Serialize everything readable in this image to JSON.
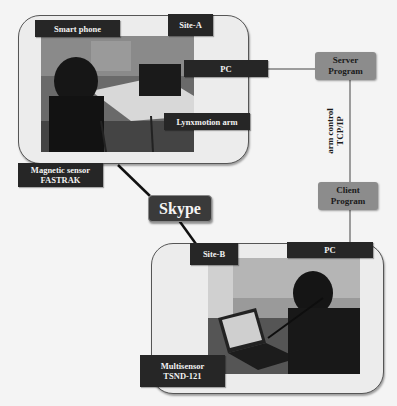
{
  "diagram": {
    "site_a": {
      "label": "Site-A",
      "components": {
        "smart_phone": "Smart phone",
        "pc": "PC",
        "arm": "Lynxmotion arm",
        "sensor_line1": "Magnetic sensor",
        "sensor_line2": "FASTRAK"
      }
    },
    "site_b": {
      "label": "Site-B",
      "components": {
        "pc": "PC",
        "sensor_line1": "Multisensor",
        "sensor_line2": "TSND-121"
      }
    },
    "server": {
      "line1": "Server",
      "line2": "Program"
    },
    "client": {
      "line1": "Client",
      "line2": "Program"
    },
    "link_label": {
      "line1": "arm control",
      "line2": "TCP/IP"
    },
    "skype": "Skype",
    "colors": {
      "label_bg": "#262626",
      "program_bg": "#8c8c8c",
      "skype_bg": "#3a3a3a",
      "site_bg": "#ececec"
    }
  }
}
